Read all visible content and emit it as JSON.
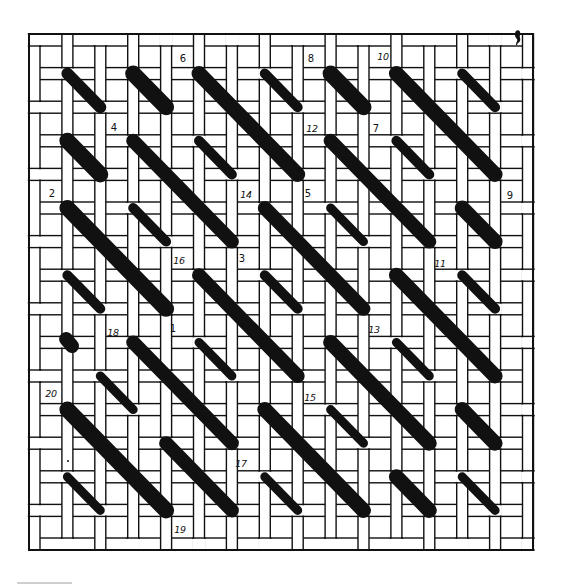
{
  "diagram": {
    "title": "",
    "ink_color": "#111111",
    "paper_color": "#ffffff",
    "canvas": {
      "frame": {
        "x": 29,
        "y": 34,
        "w": 504,
        "h": 516,
        "stroke_width": 2
      },
      "cols": 16,
      "rows": 16,
      "col_origin": 29,
      "col_step": 32.9,
      "thread_w": 11,
      "row_origin": 34,
      "row_step": 33.6,
      "thread_h": 12,
      "line_width": 1.4,
      "weave": "plain"
    },
    "stitches": [
      {
        "from": [
          1,
          1
        ],
        "to": [
          2,
          2
        ],
        "w": 12
      },
      {
        "from": [
          3,
          1
        ],
        "to": [
          4,
          2
        ],
        "w": 16
      },
      {
        "from": [
          5,
          1
        ],
        "to": [
          8,
          4
        ],
        "w": 15
      },
      {
        "from": [
          7,
          1
        ],
        "to": [
          8,
          2
        ],
        "w": 10
      },
      {
        "from": [
          9,
          1
        ],
        "to": [
          10,
          2
        ],
        "w": 16
      },
      {
        "from": [
          11,
          1
        ],
        "to": [
          14,
          4
        ],
        "w": 15
      },
      {
        "from": [
          13,
          1
        ],
        "to": [
          14,
          2
        ],
        "w": 10
      },
      {
        "from": [
          1,
          3
        ],
        "to": [
          2,
          4
        ],
        "w": 16
      },
      {
        "from": [
          3,
          3
        ],
        "to": [
          6,
          6
        ],
        "w": 14
      },
      {
        "from": [
          5,
          3
        ],
        "to": [
          6,
          4
        ],
        "w": 10
      },
      {
        "from": [
          9,
          3
        ],
        "to": [
          12,
          6
        ],
        "w": 14
      },
      {
        "from": [
          11,
          3
        ],
        "to": [
          12,
          4
        ],
        "w": 10
      },
      {
        "from": [
          1,
          5
        ],
        "to": [
          4,
          8
        ],
        "w": 16
      },
      {
        "from": [
          3,
          5
        ],
        "to": [
          4,
          6
        ],
        "w": 10
      },
      {
        "from": [
          7,
          5
        ],
        "to": [
          10,
          8
        ],
        "w": 14
      },
      {
        "from": [
          9,
          5
        ],
        "to": [
          10,
          6
        ],
        "w": 9
      },
      {
        "from": [
          13,
          5
        ],
        "to": [
          14,
          6
        ],
        "w": 15
      },
      {
        "from": [
          1,
          7
        ],
        "to": [
          2,
          8
        ],
        "w": 10
      },
      {
        "from": [
          5,
          7
        ],
        "to": [
          8,
          10
        ],
        "w": 14
      },
      {
        "from": [
          7,
          7
        ],
        "to": [
          8,
          8
        ],
        "w": 10
      },
      {
        "from": [
          11,
          7
        ],
        "to": [
          14,
          10
        ],
        "w": 15
      },
      {
        "from": [
          13,
          7
        ],
        "to": [
          14,
          8
        ],
        "w": 10
      },
      {
        "from": [
          0.96,
          8.9
        ],
        "to": [
          1.14,
          9.11
        ],
        "w": 14
      },
      {
        "from": [
          3,
          9
        ],
        "to": [
          6,
          12
        ],
        "w": 14
      },
      {
        "from": [
          5,
          9
        ],
        "to": [
          6,
          10
        ],
        "w": 9
      },
      {
        "from": [
          9,
          9
        ],
        "to": [
          12,
          12
        ],
        "w": 15
      },
      {
        "from": [
          11,
          9
        ],
        "to": [
          12,
          10
        ],
        "w": 9
      },
      {
        "from": [
          2,
          10
        ],
        "to": [
          3,
          11
        ],
        "w": 9
      },
      {
        "from": [
          1,
          11
        ],
        "to": [
          4,
          14
        ],
        "w": 16
      },
      {
        "from": [
          7,
          11
        ],
        "to": [
          10,
          14
        ],
        "w": 15
      },
      {
        "from": [
          9,
          11
        ],
        "to": [
          10,
          12
        ],
        "w": 9
      },
      {
        "from": [
          13,
          11
        ],
        "to": [
          14,
          12
        ],
        "w": 15
      },
      {
        "from": [
          4,
          12
        ],
        "to": [
          6,
          14
        ],
        "w": 14
      },
      {
        "from": [
          1,
          13
        ],
        "to": [
          2,
          14
        ],
        "w": 9
      },
      {
        "from": [
          7,
          13
        ],
        "to": [
          8,
          14
        ],
        "w": 9
      },
      {
        "from": [
          11,
          13
        ],
        "to": [
          12,
          14
        ],
        "w": 15
      },
      {
        "from": [
          13,
          13
        ],
        "to": [
          14,
          14
        ],
        "w": 9
      }
    ],
    "labels": [
      {
        "text": "1",
        "x": 173,
        "y": 328
      },
      {
        "text": "2",
        "x": 52,
        "y": 193
      },
      {
        "text": "3",
        "x": 242,
        "y": 258
      },
      {
        "text": "4",
        "x": 114,
        "y": 127
      },
      {
        "text": "5",
        "x": 308,
        "y": 193
      },
      {
        "text": "6",
        "x": 183,
        "y": 58
      },
      {
        "text": "7",
        "x": 376,
        "y": 128
      },
      {
        "text": "8",
        "x": 311,
        "y": 58
      },
      {
        "text": "9",
        "x": 510,
        "y": 195
      },
      {
        "text": "10",
        "x": 383,
        "y": 56
      },
      {
        "text": "11",
        "x": 440,
        "y": 263
      },
      {
        "text": "12",
        "x": 312,
        "y": 128
      },
      {
        "text": "13",
        "x": 374,
        "y": 329
      },
      {
        "text": "14",
        "x": 246,
        "y": 194
      },
      {
        "text": "15",
        "x": 310,
        "y": 397
      },
      {
        "text": "16",
        "x": 179,
        "y": 260
      },
      {
        "text": "17",
        "x": 241,
        "y": 463
      },
      {
        "text": "18",
        "x": 113,
        "y": 332
      },
      {
        "text": "19",
        "x": 180,
        "y": 529
      },
      {
        "text": "20",
        "x": 51,
        "y": 393
      }
    ],
    "marks": {
      "ink_blob": {
        "x": 518,
        "y": 37
      },
      "dot": {
        "x": 68,
        "y": 461,
        "r": 1
      },
      "edge_bar": {
        "x": 17,
        "y": 582,
        "w": 55,
        "h": 2,
        "color": "#cfcfcf"
      }
    }
  }
}
